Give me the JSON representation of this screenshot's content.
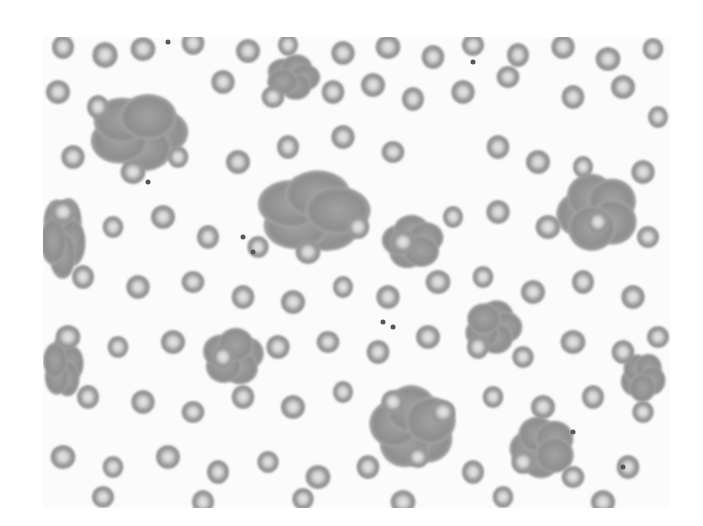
{
  "image": {
    "subject": "blood smear micrograph",
    "description": "Grayscale light-microscopy field of red blood cells with central pallor, several rouleaux/agglutinated clumps, and scattered platelets",
    "frame": {
      "x": 43,
      "y": 37,
      "width": 627,
      "height": 471
    },
    "colors": {
      "background": "#fbfbfb",
      "cell_rim": "#8a8a8a",
      "cell_body": "#9c9c9c",
      "cell_center": "#e4e4e4",
      "clump": "#8e8e8e",
      "platelet": "#555555"
    }
  },
  "cells": [
    [
      20,
      10,
      12
    ],
    [
      62,
      18,
      13
    ],
    [
      100,
      12,
      12
    ],
    [
      150,
      6,
      12
    ],
    [
      205,
      14,
      12
    ],
    [
      245,
      8,
      11
    ],
    [
      300,
      16,
      12
    ],
    [
      345,
      10,
      12
    ],
    [
      390,
      20,
      12
    ],
    [
      430,
      8,
      11
    ],
    [
      475,
      18,
      12
    ],
    [
      520,
      10,
      12
    ],
    [
      565,
      22,
      12
    ],
    [
      610,
      12,
      11
    ],
    [
      15,
      55,
      12
    ],
    [
      55,
      70,
      12
    ],
    [
      180,
      45,
      12
    ],
    [
      230,
      60,
      11
    ],
    [
      290,
      55,
      12
    ],
    [
      330,
      48,
      12
    ],
    [
      370,
      62,
      12
    ],
    [
      420,
      55,
      12
    ],
    [
      465,
      40,
      11
    ],
    [
      530,
      60,
      12
    ],
    [
      580,
      50,
      12
    ],
    [
      615,
      80,
      11
    ],
    [
      30,
      120,
      12
    ],
    [
      90,
      135,
      12
    ],
    [
      135,
      120,
      11
    ],
    [
      195,
      125,
      12
    ],
    [
      245,
      110,
      12
    ],
    [
      300,
      100,
      12
    ],
    [
      350,
      115,
      11
    ],
    [
      455,
      110,
      12
    ],
    [
      495,
      125,
      12
    ],
    [
      540,
      130,
      11
    ],
    [
      600,
      135,
      12
    ],
    [
      20,
      175,
      12
    ],
    [
      70,
      190,
      11
    ],
    [
      120,
      180,
      12
    ],
    [
      165,
      200,
      12
    ],
    [
      215,
      210,
      11
    ],
    [
      265,
      215,
      12
    ],
    [
      315,
      190,
      12
    ],
    [
      360,
      205,
      12
    ],
    [
      410,
      180,
      11
    ],
    [
      455,
      175,
      12
    ],
    [
      505,
      190,
      12
    ],
    [
      555,
      185,
      12
    ],
    [
      605,
      200,
      11
    ],
    [
      40,
      240,
      12
    ],
    [
      95,
      250,
      12
    ],
    [
      150,
      245,
      11
    ],
    [
      200,
      260,
      12
    ],
    [
      250,
      265,
      12
    ],
    [
      300,
      250,
      11
    ],
    [
      345,
      260,
      12
    ],
    [
      395,
      245,
      12
    ],
    [
      440,
      240,
      11
    ],
    [
      490,
      255,
      12
    ],
    [
      540,
      245,
      12
    ],
    [
      590,
      260,
      12
    ],
    [
      25,
      300,
      12
    ],
    [
      75,
      310,
      11
    ],
    [
      130,
      305,
      12
    ],
    [
      180,
      320,
      12
    ],
    [
      235,
      310,
      12
    ],
    [
      285,
      305,
      11
    ],
    [
      335,
      315,
      12
    ],
    [
      385,
      300,
      12
    ],
    [
      435,
      310,
      12
    ],
    [
      480,
      320,
      11
    ],
    [
      530,
      305,
      12
    ],
    [
      580,
      315,
      12
    ],
    [
      615,
      300,
      11
    ],
    [
      45,
      360,
      12
    ],
    [
      100,
      365,
      12
    ],
    [
      150,
      375,
      11
    ],
    [
      200,
      360,
      12
    ],
    [
      250,
      370,
      12
    ],
    [
      300,
      355,
      11
    ],
    [
      350,
      365,
      12
    ],
    [
      400,
      375,
      12
    ],
    [
      450,
      360,
      11
    ],
    [
      500,
      370,
      12
    ],
    [
      550,
      360,
      12
    ],
    [
      600,
      375,
      11
    ],
    [
      20,
      420,
      12
    ],
    [
      70,
      430,
      11
    ],
    [
      125,
      420,
      12
    ],
    [
      175,
      435,
      12
    ],
    [
      225,
      425,
      11
    ],
    [
      275,
      440,
      12
    ],
    [
      325,
      430,
      12
    ],
    [
      375,
      420,
      11
    ],
    [
      430,
      435,
      12
    ],
    [
      480,
      425,
      12
    ],
    [
      530,
      440,
      11
    ],
    [
      585,
      430,
      12
    ],
    [
      60,
      460,
      11
    ],
    [
      160,
      465,
      12
    ],
    [
      260,
      462,
      11
    ],
    [
      360,
      465,
      12
    ],
    [
      460,
      460,
      11
    ],
    [
      560,
      465,
      12
    ]
  ],
  "clumps": [
    [
      95,
      95,
      48,
      38
    ],
    [
      270,
      175,
      55,
      40
    ],
    [
      370,
      205,
      30,
      26
    ],
    [
      555,
      175,
      40,
      38
    ],
    [
      20,
      200,
      22,
      40
    ],
    [
      450,
      290,
      28,
      26
    ],
    [
      190,
      320,
      30,
      28
    ],
    [
      370,
      390,
      42,
      40
    ],
    [
      500,
      410,
      32,
      30
    ],
    [
      600,
      340,
      22,
      24
    ],
    [
      250,
      40,
      26,
      22
    ],
    [
      20,
      330,
      20,
      30
    ]
  ],
  "platelets": [
    [
      105,
      145
    ],
    [
      200,
      200
    ],
    [
      210,
      215
    ],
    [
      340,
      285
    ],
    [
      350,
      290
    ],
    [
      530,
      395
    ],
    [
      430,
      25
    ],
    [
      125,
      5
    ],
    [
      580,
      430
    ]
  ]
}
